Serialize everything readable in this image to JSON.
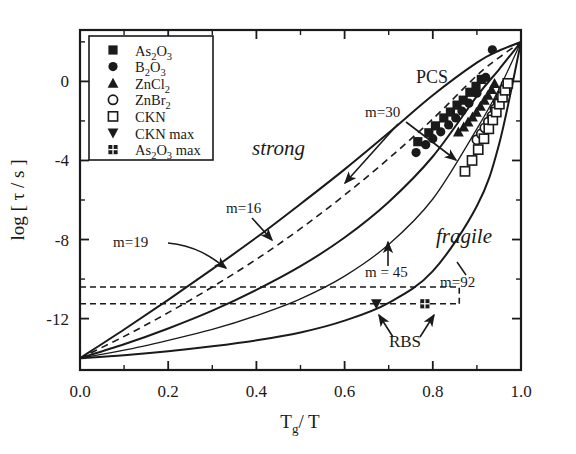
{
  "figure": {
    "type": "angell-plot",
    "background": "#ffffff",
    "ink": "#1a1a1a"
  },
  "axes": {
    "x_label": "T",
    "x_label_sub": "g",
    "x_label_tail": "/ T",
    "y_label_pre": "log [ ",
    "y_label_tau": "τ",
    "y_label_post": " / s ]",
    "x_ticks": [
      "0.0",
      "0.2",
      "0.4",
      "0.6",
      "0.8",
      "1.0"
    ],
    "y_ticks": [
      "0",
      "-4",
      "-8",
      "-12"
    ],
    "xlim": [
      0.0,
      1.0
    ],
    "ylim": [
      -14.6,
      2.6
    ],
    "minor_x_count": 5,
    "minor_y_count": 7
  },
  "legend": {
    "items": [
      {
        "marker": "filled-square",
        "label": "As",
        "sub1": "2",
        "mid": "O",
        "sub2": "3",
        "tail": ""
      },
      {
        "marker": "filled-circle",
        "label": "B",
        "sub1": "2",
        "mid": "O",
        "sub2": "3",
        "tail": ""
      },
      {
        "marker": "filled-triangle-up",
        "label": "ZnCl",
        "sub1": "2",
        "mid": "",
        "sub2": "",
        "tail": ""
      },
      {
        "marker": "open-circle",
        "label": "ZnBr",
        "sub1": "2",
        "mid": "",
        "sub2": "",
        "tail": ""
      },
      {
        "marker": "open-square",
        "label": "CKN",
        "sub1": "",
        "mid": "",
        "sub2": "",
        "tail": ""
      },
      {
        "marker": "filled-triangle-down",
        "label": "CKN max",
        "sub1": "",
        "mid": "",
        "sub2": "",
        "tail": ""
      },
      {
        "marker": "crossed-square",
        "label": "As",
        "sub1": "2",
        "mid": "O",
        "sub2": "3",
        "tail": " max"
      }
    ]
  },
  "annotations": {
    "pcs": "PCS",
    "strong": "strong",
    "fragile": "fragile",
    "rbs": "RBS",
    "m30": "m=30",
    "m16": "m=16",
    "m19": "m=19",
    "m45": "m  = 45",
    "m92": "m=92"
  },
  "chart_data": {
    "type": "line",
    "title": "",
    "xlabel": "Tg / T",
    "ylabel": "log [ tau / s ]",
    "xlim": [
      0.0,
      1.0
    ],
    "ylim": [
      -14.6,
      2.6
    ],
    "grid": false,
    "legend_position": "upper-left",
    "note": "Angell plot of log relaxation time vs Tg/T. All curves converge at (0,-14) and (1,+2). Fragility index m labels each curve.",
    "curves": [
      {
        "name": "m=16",
        "m": 16,
        "style": "solid",
        "x": [
          0.0,
          0.1,
          0.2,
          0.3,
          0.4,
          0.5,
          0.6,
          0.7,
          0.8,
          0.9,
          0.95,
          1.0
        ],
        "y": [
          -14.0,
          -12.55,
          -11.05,
          -9.5,
          -7.9,
          -6.2,
          -4.45,
          -2.6,
          -0.7,
          0.95,
          1.55,
          2.0
        ]
      },
      {
        "name": "m=19",
        "m": 19,
        "style": "dashed",
        "x": [
          0.0,
          0.1,
          0.2,
          0.3,
          0.4,
          0.5,
          0.6,
          0.7,
          0.8,
          0.9,
          0.95,
          1.0
        ],
        "y": [
          -14.0,
          -12.9,
          -11.7,
          -10.4,
          -9.0,
          -7.45,
          -5.75,
          -3.9,
          -1.9,
          0.3,
          1.2,
          2.0
        ]
      },
      {
        "name": "m=30",
        "m": 30,
        "style": "solid",
        "x": [
          0.0,
          0.1,
          0.2,
          0.3,
          0.4,
          0.5,
          0.6,
          0.7,
          0.8,
          0.9,
          0.95,
          1.0
        ],
        "y": [
          -14.0,
          -13.3,
          -12.5,
          -11.6,
          -10.55,
          -9.35,
          -7.9,
          -6.1,
          -3.8,
          -0.75,
          0.6,
          2.0
        ]
      },
      {
        "name": "m=45",
        "m": 45,
        "style": "solid-thin",
        "x": [
          0.0,
          0.1,
          0.2,
          0.3,
          0.4,
          0.5,
          0.6,
          0.7,
          0.8,
          0.9,
          0.95,
          1.0
        ],
        "y": [
          -14.0,
          -13.6,
          -13.1,
          -12.55,
          -11.85,
          -11.0,
          -9.85,
          -8.25,
          -5.95,
          -2.4,
          -0.4,
          2.0
        ]
      },
      {
        "name": "m=92",
        "m": 92,
        "style": "solid",
        "x": [
          0.0,
          0.1,
          0.2,
          0.3,
          0.4,
          0.5,
          0.6,
          0.7,
          0.8,
          0.9,
          0.95,
          1.0
        ],
        "y": [
          -14.0,
          -13.85,
          -13.65,
          -13.4,
          -13.1,
          -12.7,
          -12.1,
          -11.2,
          -9.6,
          -6.3,
          -3.2,
          2.0
        ]
      }
    ],
    "reference_lines": [
      {
        "name": "dashed-horizontal-upper",
        "y": -10.4,
        "x_from": 0.0,
        "x_to": 0.86,
        "style": "dashed"
      },
      {
        "name": "dashed-horizontal-lower",
        "y": -11.25,
        "x_from": 0.0,
        "x_to": 0.86,
        "style": "dashed"
      },
      {
        "name": "dashed-box-right",
        "x": 0.86,
        "y_from": -11.25,
        "y_to": -10.4,
        "style": "dashed"
      }
    ],
    "series": [
      {
        "name": "As2O3",
        "marker": "filled-square",
        "x": [
          0.766,
          0.791,
          0.806,
          0.825,
          0.84,
          0.855,
          0.869,
          0.884,
          0.898,
          0.91
        ],
        "y": [
          -3.05,
          -2.6,
          -2.25,
          -1.85,
          -1.55,
          -1.2,
          -0.95,
          -0.55,
          -0.25,
          0.1
        ]
      },
      {
        "name": "B2O3",
        "marker": "filled-circle",
        "x": [
          0.762,
          0.784,
          0.8,
          0.818,
          0.836,
          0.852,
          0.866,
          0.882,
          0.9,
          0.92,
          0.935
        ],
        "y": [
          -3.6,
          -3.2,
          -2.9,
          -2.55,
          -2.2,
          -1.85,
          -1.5,
          -1.1,
          -0.6,
          0.2,
          1.6
        ]
      },
      {
        "name": "ZnCl2",
        "marker": "filled-triangle-up",
        "x": [
          0.858,
          0.87,
          0.88,
          0.89,
          0.899,
          0.908,
          0.917,
          0.925,
          0.933,
          0.94
        ],
        "y": [
          -2.55,
          -2.3,
          -2.05,
          -1.8,
          -1.55,
          -1.25,
          -0.95,
          -0.7,
          -0.4,
          -0.1
        ]
      },
      {
        "name": "ZnBr2",
        "marker": "open-circle",
        "x": [
          0.9,
          0.91,
          0.918,
          0.926,
          0.934,
          0.941,
          0.948,
          0.954,
          0.96,
          0.966
        ],
        "y": [
          -2.95,
          -2.65,
          -2.35,
          -2.05,
          -1.75,
          -1.4,
          -1.05,
          -0.75,
          -0.45,
          -0.15
        ]
      },
      {
        "name": "CKN",
        "marker": "open-square",
        "x": [
          0.873,
          0.889,
          0.903,
          0.916,
          0.927,
          0.936,
          0.944,
          0.951,
          0.958,
          0.964,
          0.97
        ],
        "y": [
          -4.55,
          -4.0,
          -3.45,
          -2.9,
          -2.4,
          -1.95,
          -1.55,
          -1.15,
          -0.8,
          -0.45,
          -0.1
        ]
      },
      {
        "name": "CKN max",
        "marker": "filled-triangle-down",
        "x": [
          0.672
        ],
        "y": [
          -11.25
        ]
      },
      {
        "name": "As2O3 max",
        "marker": "crossed-square",
        "x": [
          0.782
        ],
        "y": [
          -11.25
        ]
      }
    ]
  }
}
